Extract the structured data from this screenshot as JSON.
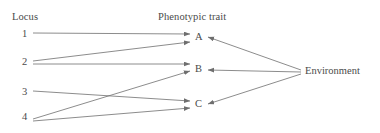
{
  "diagram": {
    "type": "genotype-phenotype-map",
    "headers": {
      "left": "Locus",
      "right": "Phenotypic trait"
    },
    "loci": [
      {
        "id": "1",
        "label": "1",
        "x": 27,
        "y": 34
      },
      {
        "id": "2",
        "label": "2",
        "x": 27,
        "y": 62
      },
      {
        "id": "3",
        "label": "3",
        "x": 27,
        "y": 92
      },
      {
        "id": "4",
        "label": "4",
        "x": 27,
        "y": 117
      }
    ],
    "traits": [
      {
        "id": "A",
        "label": "A",
        "x": 196,
        "y": 38
      },
      {
        "id": "B",
        "label": "B",
        "x": 196,
        "y": 70
      },
      {
        "id": "C",
        "label": "C",
        "x": 196,
        "y": 105
      }
    ],
    "environment": {
      "id": "Environment",
      "label": "Environment",
      "x": 305,
      "y": 72
    },
    "edges": [
      {
        "from": "1",
        "to": "A",
        "x1": 33,
        "y1": 33,
        "x2": 190,
        "y2": 34
      },
      {
        "from": "2",
        "to": "A",
        "x1": 33,
        "y1": 61,
        "x2": 190,
        "y2": 42
      },
      {
        "from": "2",
        "to": "B",
        "x1": 33,
        "y1": 64,
        "x2": 190,
        "y2": 64
      },
      {
        "from": "3",
        "to": "C",
        "x1": 33,
        "y1": 91,
        "x2": 190,
        "y2": 101
      },
      {
        "from": "4",
        "to": "B",
        "x1": 33,
        "y1": 119,
        "x2": 190,
        "y2": 71
      },
      {
        "from": "4",
        "to": "C",
        "x1": 33,
        "y1": 121,
        "x2": 190,
        "y2": 108
      },
      {
        "from": "Environment",
        "to": "A",
        "x1": 301,
        "y1": 70,
        "x2": 208,
        "y2": 37
      },
      {
        "from": "Environment",
        "to": "B",
        "x1": 301,
        "y1": 72,
        "x2": 208,
        "y2": 70
      },
      {
        "from": "Environment",
        "to": "C",
        "x1": 301,
        "y1": 74,
        "x2": 208,
        "y2": 104
      }
    ],
    "style": {
      "line_color": "#6e6e6e",
      "text_color": "#4a4a4a",
      "background": "#ffffff",
      "line_width": 0.8
    }
  }
}
